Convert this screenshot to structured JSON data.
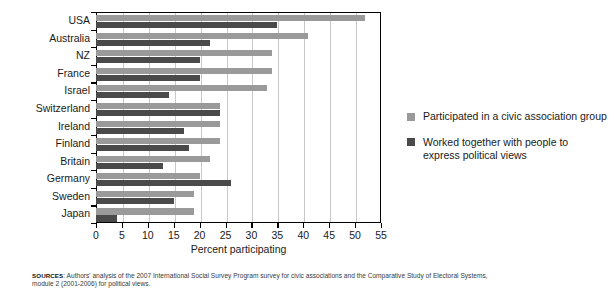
{
  "chart_data": {
    "type": "bar",
    "orientation": "horizontal",
    "title": "",
    "xlabel": "Percent participating",
    "ylabel": "",
    "xlim": [
      0,
      55
    ],
    "xticks": [
      0,
      5,
      10,
      15,
      20,
      25,
      30,
      35,
      40,
      45,
      50,
      55
    ],
    "grid": "vertical",
    "legend_position": "right",
    "categories": [
      "USA",
      "Australia",
      "NZ",
      "France",
      "Israel",
      "Switzerland",
      "Ireland",
      "Finland",
      "Britain",
      "Germany",
      "Sweden",
      "Japan"
    ],
    "series": [
      {
        "name": "Participated in a civic association group",
        "color": "#9a9a9a",
        "values": [
          52,
          41,
          34,
          34,
          33,
          24,
          24,
          24,
          22,
          20,
          19,
          19
        ]
      },
      {
        "name": "Worked together with people to express political views",
        "color": "#4a4a4a",
        "values": [
          35,
          22,
          20,
          20,
          14,
          24,
          17,
          18,
          13,
          26,
          15,
          4
        ]
      }
    ]
  },
  "axis": {
    "x_title": "Percent participating",
    "tick_labels": [
      "0",
      "5",
      "10",
      "15",
      "20",
      "25",
      "30",
      "35",
      "40",
      "45",
      "50",
      "55"
    ]
  },
  "legend": {
    "items": [
      {
        "label": "Participated in a civic association group",
        "color": "#9a9a9a"
      },
      {
        "label": "Worked together with people to express political views",
        "color": "#4a4a4a"
      }
    ]
  },
  "source": {
    "label": "SOURCES",
    "line1": ": Authors' analysis of the 2007 International Social Survey Program survey for civic associations and the Comparative Study of Electoral Systems,",
    "line2": "module 2 (2001-2006) for political views."
  }
}
